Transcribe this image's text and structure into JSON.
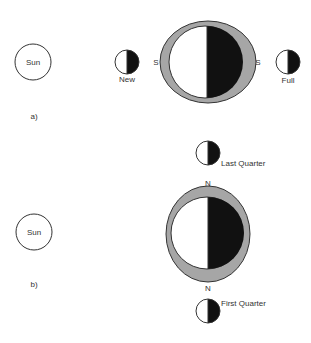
{
  "diagram": {
    "panel_a": {
      "label": "a)",
      "sun": {
        "label": "Sun"
      },
      "earth_orbit_markers": {
        "left": "S",
        "right": "S"
      },
      "moons": [
        {
          "phase": "new",
          "label": "New"
        },
        {
          "phase": "full",
          "label": "Full"
        }
      ]
    },
    "panel_b": {
      "label": "b)",
      "sun": {
        "label": "Sun"
      },
      "earth_orbit_markers": {
        "top": "N",
        "bottom": "N"
      },
      "moons": [
        {
          "phase": "last-quarter",
          "label": "Last Quarter"
        },
        {
          "phase": "first-quarter",
          "label": "First Quarter"
        }
      ]
    },
    "colors": {
      "outline": "#333333",
      "ring": "#a6a6a6",
      "dark_side": "#111111",
      "light_side": "#ffffff"
    }
  }
}
